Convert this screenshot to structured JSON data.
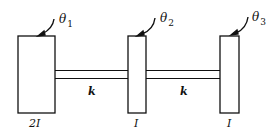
{
  "diagram": {
    "type": "torsional-system",
    "disks": [
      {
        "id": "disk-1",
        "inertia_label": "2I",
        "angle_symbol": "θ",
        "angle_sub": "1"
      },
      {
        "id": "disk-2",
        "inertia_label": "I",
        "angle_symbol": "θ",
        "angle_sub": "2"
      },
      {
        "id": "disk-3",
        "inertia_label": "I",
        "angle_symbol": "θ",
        "angle_sub": "3"
      }
    ],
    "shafts": [
      {
        "id": "shaft-1",
        "stiffness_label": "k"
      },
      {
        "id": "shaft-2",
        "stiffness_label": "k"
      }
    ],
    "colors": {
      "stroke": "#111111",
      "background": "#ffffff"
    }
  }
}
